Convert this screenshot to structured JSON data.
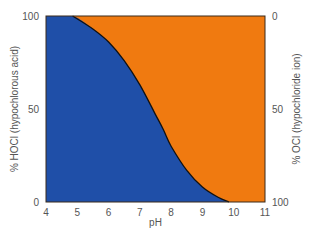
{
  "chart_data": {
    "type": "area",
    "title": "",
    "xlabel": "pH",
    "ylabel_left": "% HOCl (hypochlorous acid)",
    "ylabel_right": "% OCl (hypochloride ion)",
    "xlim": [
      4,
      11
    ],
    "ylim_left": [
      0,
      100
    ],
    "ylim_right": [
      100,
      0
    ],
    "x_ticks": [
      4,
      5,
      6,
      7,
      8,
      9,
      10,
      11
    ],
    "y_ticks_left": [
      0,
      50,
      100
    ],
    "y_ticks_right": [
      100,
      50,
      0
    ],
    "grid": false,
    "legend": null,
    "x": [
      4.0,
      4.85,
      5.5,
      6.0,
      6.5,
      7.0,
      7.5,
      7.75,
      8.0,
      8.5,
      9.0,
      9.5,
      9.85,
      10.0,
      10.5,
      11.0
    ],
    "series": [
      {
        "name": "HOCl (hypochlorous acid)",
        "color": "#1f4fa8",
        "values": [
          100,
          100,
          93,
          86,
          76,
          63,
          47,
          39,
          30,
          17,
          8,
          2.5,
          0,
          0,
          0,
          0
        ]
      },
      {
        "name": "OCl (hypochloride ion)",
        "color": "#f07a10",
        "values": [
          0,
          0,
          7,
          14,
          24,
          37,
          53,
          61,
          70,
          83,
          92,
          97.5,
          100,
          100,
          100,
          100
        ]
      }
    ],
    "boundary_color": "#111111"
  }
}
